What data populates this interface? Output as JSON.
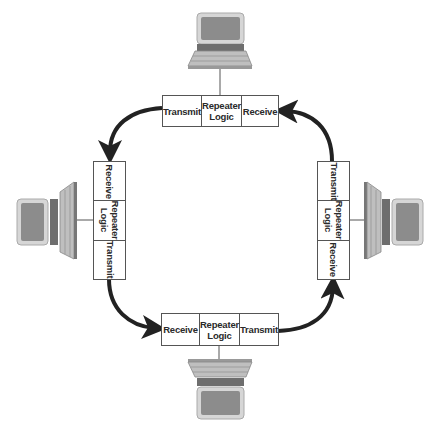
{
  "diagram": {
    "type": "token-ring-network",
    "colors": {
      "arrow": "#222222",
      "box_border": "#555555",
      "monitor_bezel": "#d0d0d0",
      "screen": "#8a8a8a",
      "keyboard": "#bdbdbd"
    },
    "nodes": [
      {
        "id": "top",
        "icon": "computer-icon",
        "cells": [
          {
            "label": "Transmit"
          },
          {
            "label": "Repeater\nLogic"
          },
          {
            "label": "Receive"
          }
        ]
      },
      {
        "id": "left",
        "icon": "computer-icon",
        "cells": [
          {
            "label": "Receive"
          },
          {
            "label": "Repeater\nLogic"
          },
          {
            "label": "Transmit"
          }
        ]
      },
      {
        "id": "right",
        "icon": "computer-icon",
        "cells": [
          {
            "label": "Transmit"
          },
          {
            "label": "Repeater\nLogic"
          },
          {
            "label": "Receive"
          }
        ]
      },
      {
        "id": "bottom",
        "icon": "computer-icon",
        "cells": [
          {
            "label": "Receive"
          },
          {
            "label": "Repeater\nLogic"
          },
          {
            "label": "Transmit"
          }
        ]
      }
    ],
    "edges": [
      {
        "from": "top.Transmit",
        "to": "left.Receive",
        "icon": "curved-arrow-icon"
      },
      {
        "from": "left.Transmit",
        "to": "bottom.Receive",
        "icon": "curved-arrow-icon"
      },
      {
        "from": "bottom.Transmit",
        "to": "right.Receive",
        "icon": "curved-arrow-icon"
      },
      {
        "from": "right.Transmit",
        "to": "top.Receive",
        "icon": "curved-arrow-icon"
      }
    ]
  }
}
